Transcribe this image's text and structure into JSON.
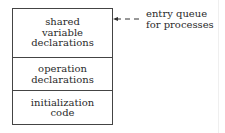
{
  "diagram": {
    "sections": [
      {
        "label": "shared\nvariable\ndeclarations"
      },
      {
        "label": "operation\ndeclarations"
      },
      {
        "label": "initialization\ncode"
      }
    ],
    "annotation": {
      "label": "entry queue\nfor processes",
      "arrow": "dashed-arrow-left"
    },
    "colors": {
      "stroke": "#444444",
      "text": "#2a2a2a",
      "background": "#ffffff"
    }
  }
}
